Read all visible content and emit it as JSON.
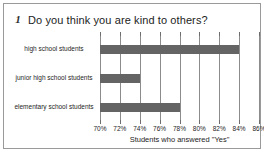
{
  "frame": {
    "border_color": "#9a9a9a",
    "background": "#ffffff"
  },
  "title": {
    "number": "1",
    "text": "Do you think you are kind to others?"
  },
  "chart_data": {
    "type": "bar",
    "orientation": "horizontal",
    "title": "Do you think you are kind to others?",
    "categories": [
      "high school students",
      "junior high school students",
      "elementary school students"
    ],
    "values": [
      84,
      74,
      78
    ],
    "xlabel": "Students who answered \"Yes\"",
    "ylabel": "",
    "xlim": [
      70,
      86
    ],
    "xticks": [
      70,
      72,
      74,
      76,
      78,
      80,
      82,
      84,
      86
    ],
    "xtick_labels": [
      "70%",
      "72%",
      "74%",
      "76%",
      "78%",
      "80%",
      "82%",
      "84%",
      "86%"
    ],
    "grid": true,
    "grid_axis": "x",
    "legend": false,
    "bar_color": "#646464",
    "gridline_color": "#8c8c8c"
  }
}
